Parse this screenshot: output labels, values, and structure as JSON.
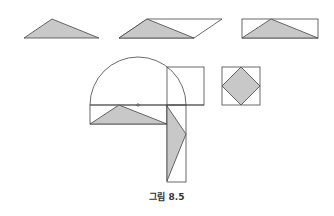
{
  "figure": {
    "caption": "그림 8.5",
    "colors": {
      "stroke": "#444444",
      "fill": "#c8c8c8",
      "background": "#ffffff"
    },
    "top_row": [
      {
        "name": "triangle",
        "points": "24,38 52,19 99,38"
      },
      {
        "name": "parallelogram",
        "outline": "119,38 147,19 222,19 194,38",
        "shaded": "119,38 147,19 194,38"
      },
      {
        "name": "rectangle-with-triangle",
        "rect": [
          242,
          19,
          76,
          19
        ],
        "shaded": "242,38 271,19 318,38",
        "diag": "242,38 271,19 318,38"
      }
    ],
    "semicircle": {
      "cx": 138,
      "cy": 105,
      "r": 48
    },
    "square_top": [
      167,
      67,
      37,
      38
    ],
    "lower_rect": [
      90,
      105,
      77,
      19
    ],
    "lower_triangle": "90,124 119,105 167,124",
    "vertical_rect": [
      167,
      105,
      19,
      77
    ],
    "vertical_triangle": "167,106 186,134 167,181",
    "diamond_square": {
      "rect": [
        222,
        67,
        38,
        38
      ],
      "diamond": "241,67 260,86 241,105 222,86"
    }
  }
}
